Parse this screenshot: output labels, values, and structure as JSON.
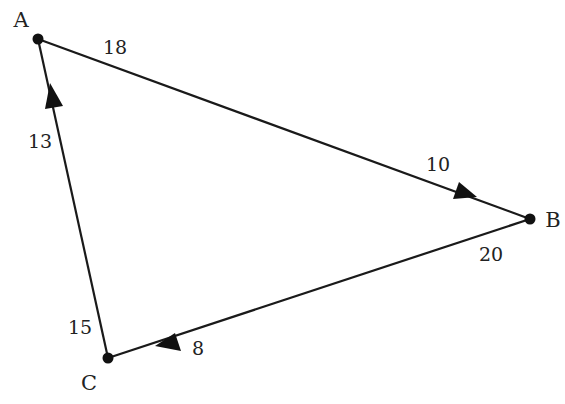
{
  "diagram": {
    "type": "directed-weighted-graph",
    "background": "#ffffff",
    "stroke_color": "#1a1a1a",
    "vertices": [
      {
        "id": "A",
        "label": "A",
        "x": 38,
        "y": 39,
        "label_x": 21,
        "label_y": 27
      },
      {
        "id": "B",
        "label": "B",
        "x": 530,
        "y": 219,
        "label_x": 553,
        "label_y": 227
      },
      {
        "id": "C",
        "label": "C",
        "x": 108,
        "y": 358,
        "label_x": 89,
        "label_y": 390
      }
    ],
    "edges": [
      {
        "id": "A-B",
        "from": "A",
        "to": "B",
        "direction": "A→B",
        "labels": [
          {
            "text": "18",
            "near": "A",
            "x": 115,
            "y": 54
          },
          {
            "text": "10",
            "near": "B",
            "x": 438,
            "y": 171
          }
        ]
      },
      {
        "id": "B-C",
        "from": "B",
        "to": "C",
        "direction": "B→C",
        "labels": [
          {
            "text": "20",
            "near": "B",
            "x": 491,
            "y": 261
          },
          {
            "text": "8",
            "near": "C",
            "x": 198,
            "y": 355
          }
        ]
      },
      {
        "id": "C-A",
        "from": "C",
        "to": "A",
        "direction": "C→A",
        "labels": [
          {
            "text": "15",
            "near": "C",
            "x": 80,
            "y": 334
          },
          {
            "text": "13",
            "near": "A",
            "x": 40,
            "y": 148
          }
        ]
      }
    ]
  },
  "labels": {
    "vertex_a": "A",
    "vertex_b": "B",
    "vertex_c": "C",
    "ab_near_a": "18",
    "ab_near_b": "10",
    "bc_near_b": "20",
    "bc_near_c": "8",
    "ca_near_c": "15",
    "ca_near_a": "13"
  }
}
